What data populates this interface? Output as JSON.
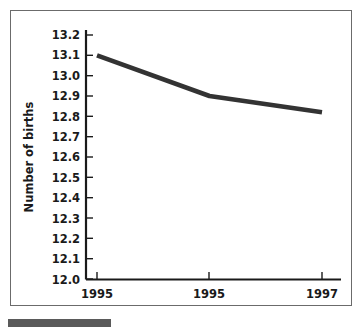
{
  "chart_data": {
    "type": "line",
    "title": "",
    "xlabel": "",
    "ylabel": "Number of births",
    "ylim": [
      12.0,
      13.2
    ],
    "grid": false,
    "legend": null,
    "categories": [
      "1995",
      "1995",
      "1997"
    ],
    "x": [
      1995,
      1996,
      1997
    ],
    "series": [
      {
        "name": "Number of births",
        "values": [
          13.1,
          12.9,
          12.82
        ],
        "color": "#333333"
      }
    ],
    "ytick_labels": [
      "13.2",
      "13.1",
      "13.0",
      "12.9",
      "12.8",
      "12.7",
      "12.6",
      "12.5",
      "12.4",
      "12.3",
      "12.2",
      "12.1",
      "12.0"
    ],
    "ytick_values": [
      13.2,
      13.1,
      13.0,
      12.9,
      12.8,
      12.7,
      12.6,
      12.5,
      12.4,
      12.3,
      12.2,
      12.1,
      12.0
    ],
    "xtick_labels": [
      "1995",
      "1995",
      "1997"
    ]
  },
  "figure": {
    "frame_color": "#6b6b6b",
    "axis_color": "#1a1a1a",
    "background": "#ffffff",
    "source_bar_color": "#5a5a5a"
  }
}
